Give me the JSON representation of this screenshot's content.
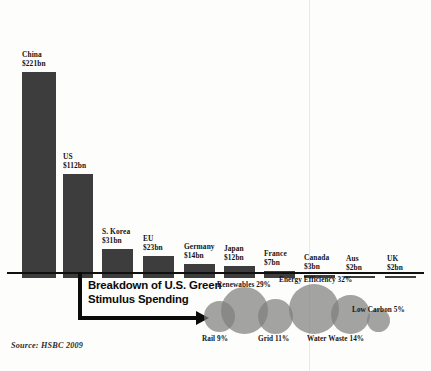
{
  "chart_data": {
    "type": "bar",
    "title": "",
    "xlabel": "",
    "ylabel": "",
    "units": "USD billion",
    "categories": [
      "China",
      "US",
      "S. Korea",
      "EU",
      "Germany",
      "Japan",
      "France",
      "Canada",
      "Aus",
      "UK"
    ],
    "values": [
      221,
      112,
      31,
      23,
      14,
      12,
      7,
      3,
      2,
      2
    ],
    "value_labels": [
      "$221bn",
      "$112bn",
      "$31bn",
      "$23bn",
      "$14bn",
      "$12bn",
      "$7bn",
      "$3bn",
      "$2bn",
      "$2bn"
    ],
    "ylim": [
      0,
      221
    ],
    "grid": false,
    "legend": "none",
    "bar_color": "#3d3d3d",
    "axis_color": "#101010",
    "source": "Source: HSBC 2009"
  },
  "chart_data_secondary": {
    "type": "pie",
    "title": "Breakdown of U.S. Green Stimulus Spending",
    "categories": [
      "Rail",
      "Renewables",
      "Grid",
      "Energy Efficiency",
      "Water Waste",
      "Low Carbon"
    ],
    "values": [
      9,
      29,
      11,
      32,
      14,
      5
    ],
    "value_labels": [
      "Rail 9%",
      "Renewables 29%",
      "Grid 11%",
      "Energy Efficiency 32%",
      "Water Waste 14%",
      "Low Carbon 5%"
    ],
    "bubble_color": "rgba(128,128,128,0.72)",
    "total_percent": 100
  },
  "bars": [
    {
      "name": "china",
      "country": "China",
      "value_label": "$221bn",
      "value": 221
    },
    {
      "name": "us",
      "country": "US",
      "value_label": "$112bn",
      "value": 112
    },
    {
      "name": "s-korea",
      "country": "S. Korea",
      "value_label": "$31bn",
      "value": 31
    },
    {
      "name": "eu",
      "country": "EU",
      "value_label": "$23bn",
      "value": 23
    },
    {
      "name": "germany",
      "country": "Germany",
      "value_label": "$14bn",
      "value": 14
    },
    {
      "name": "japan",
      "country": "Japan",
      "value_label": "$12bn",
      "value": 12
    },
    {
      "name": "france",
      "country": "France",
      "value_label": "$7bn",
      "value": 7
    },
    {
      "name": "canada",
      "country": "Canada",
      "value_label": "$3bn",
      "value": 3
    },
    {
      "name": "aus",
      "country": "Aus",
      "value_label": "$2bn",
      "value": 2
    },
    {
      "name": "uk",
      "country": "UK",
      "value_label": "$2bn",
      "value": 2
    }
  ],
  "callout": {
    "line1": "Breakdown of U.S. Green",
    "line2": "Stimulus Spending"
  },
  "bubbles": [
    {
      "name": "rail",
      "label": "Rail 9%",
      "percent": 9
    },
    {
      "name": "renewables",
      "label": "Renewables 29%",
      "percent": 29
    },
    {
      "name": "grid",
      "label": "Grid 11%",
      "percent": 11
    },
    {
      "name": "energy-efficiency",
      "label": "Energy Efficiency 32%",
      "percent": 32
    },
    {
      "name": "water-waste",
      "label": "Water Waste 14%",
      "percent": 14
    },
    {
      "name": "low-carbon",
      "label": "Low Carbon 5%",
      "percent": 5
    }
  ],
  "source": {
    "text": "Source: HSBC 2009"
  },
  "colors": {
    "bar": "#3d3d3d",
    "axis": "#101010",
    "bubble": "rgba(128,128,128,0.72)",
    "background": "#fdfdfc",
    "text": "#141414"
  }
}
